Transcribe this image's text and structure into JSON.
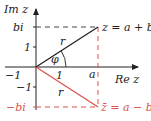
{
  "diagram": {
    "type": "complex-plane",
    "axes": {
      "y_label": "Im z",
      "x_label": "Re z",
      "origin": [
        36,
        67
      ]
    },
    "ticks": {
      "y_pos_one": "1",
      "y_neg_one": "−1",
      "x_neg_one": "−1",
      "x_one": "1",
      "x_a": "a",
      "y_bi": "bi",
      "y_neg_bi": "−bi"
    },
    "labels": {
      "z": "z = a + bi",
      "z_conj": "z̄ = a − bi",
      "r_upper": "r",
      "r_lower": "r",
      "angle": "φ"
    },
    "colors": {
      "main": "#222222",
      "conjugate": "#d9534f",
      "dashed": "#444444"
    },
    "points": {
      "z": [
        98,
        27
      ],
      "z_conj": [
        98,
        107
      ]
    }
  }
}
